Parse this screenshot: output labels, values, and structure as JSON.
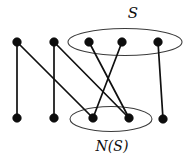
{
  "figure": {
    "type": "bipartite-graph-diagram",
    "width": 193,
    "height": 161,
    "background_color": "#ffffff",
    "edge_color": "#101010",
    "node_color": "#0d0d0d",
    "ellipse_color": "#3a3a3a"
  },
  "labels": {
    "set_s": "S",
    "set_ns": "N(S)"
  },
  "chart_data": {
    "type": "diagram",
    "title": "",
    "nodes": [
      {
        "id": "t1",
        "label": "",
        "x": 17,
        "y": 42,
        "row": "top",
        "group": "outside"
      },
      {
        "id": "t2",
        "label": "",
        "x": 54,
        "y": 42,
        "row": "top",
        "group": "outside"
      },
      {
        "id": "s1",
        "label": "",
        "x": 89,
        "y": 42,
        "row": "top",
        "group": "S"
      },
      {
        "id": "s2",
        "label": "",
        "x": 122,
        "y": 42,
        "row": "top",
        "group": "S"
      },
      {
        "id": "s3",
        "label": "",
        "x": 158,
        "y": 42,
        "row": "top",
        "group": "S"
      },
      {
        "id": "b1",
        "label": "",
        "x": 17,
        "y": 118,
        "row": "bottom",
        "group": "outside"
      },
      {
        "id": "b2",
        "label": "",
        "x": 54,
        "y": 118,
        "row": "bottom",
        "group": "outside"
      },
      {
        "id": "n1",
        "label": "",
        "x": 93,
        "y": 118,
        "row": "bottom",
        "group": "N(S)"
      },
      {
        "id": "n2",
        "label": "",
        "x": 129,
        "y": 118,
        "row": "bottom",
        "group": "N(S)"
      },
      {
        "id": "b5",
        "label": "",
        "x": 163,
        "y": 119,
        "row": "bottom",
        "group": "outside"
      }
    ],
    "node_radius": 4.3,
    "edges": [
      {
        "from": "t1",
        "to": "b1"
      },
      {
        "from": "t1",
        "to": "n1"
      },
      {
        "from": "t2",
        "to": "b2"
      },
      {
        "from": "t2",
        "to": "n2"
      },
      {
        "from": "s1",
        "to": "n2"
      },
      {
        "from": "s2",
        "to": "n1"
      },
      {
        "from": "s3",
        "to": "b5"
      }
    ],
    "groups": [
      {
        "id": "S",
        "label": "S",
        "cx": 125,
        "cy": 42,
        "rx": 57,
        "ry": 13.5,
        "label_x": 133,
        "label_y": 14
      },
      {
        "id": "N(S)",
        "label": "N(S)",
        "cx": 111,
        "cy": 119,
        "rx": 41,
        "ry": 12.5,
        "label_x": 112,
        "label_y": 147
      }
    ]
  }
}
